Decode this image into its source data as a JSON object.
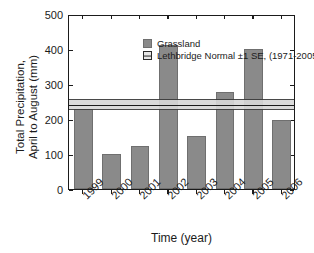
{
  "chart_data": {
    "type": "bar",
    "title": "",
    "xlabel": "Time (year)",
    "ylabel": "Total Precipitation, April to August (mm)",
    "ylabel_line1": "Total Precipitation,",
    "ylabel_line2": "April to August (mm)",
    "categories": [
      "1999",
      "2000",
      "2001",
      "2002",
      "2003",
      "2004",
      "2005",
      "2006"
    ],
    "values": [
      230,
      100,
      123,
      412,
      152,
      276,
      399,
      196
    ],
    "series": [
      {
        "name": "Grassland",
        "values": [
          230,
          100,
          123,
          412,
          152,
          276,
          399,
          196
        ],
        "color": "#8a8a8a"
      }
    ],
    "reference_band": {
      "name": "Lethbridge Normal ±1 SE, (1971-2005)",
      "mean": 244,
      "lower": 231,
      "upper": 262,
      "color": "#d8d8d8",
      "line_color": "#1b1b1b"
    },
    "ylim": [
      0,
      500
    ],
    "yticks": [
      0,
      100,
      200,
      300,
      400,
      500
    ],
    "ytick_labels": [
      "0",
      "100",
      "200",
      "300",
      "400",
      "500"
    ],
    "grid": false,
    "legend_position": "top-left"
  },
  "legend": {
    "entries": [
      {
        "label": "Grassland",
        "marker": "filled-square"
      },
      {
        "label": "Lethbridge Normal ±1 SE, (1971-2005)",
        "marker": "band-symbol"
      }
    ]
  },
  "axes": {
    "x_title": "Time (year)",
    "y_title_line1": "Total Precipitation,",
    "y_title_line2": "April to August (mm)"
  }
}
